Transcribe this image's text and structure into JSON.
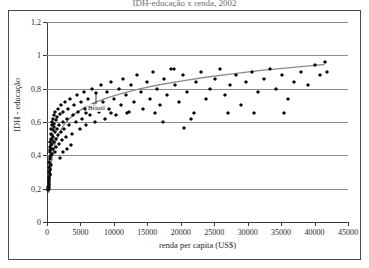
{
  "title_sliver": "IDH-educação x renda, 2002",
  "chart_data": {
    "type": "scatter",
    "title": "IDH-educação x renda, 2002",
    "xlabel": "renda per capita (US$)",
    "ylabel": "IDH - educação",
    "xlim": [
      0,
      45000
    ],
    "ylim": [
      0,
      1.2
    ],
    "xticks": [
      0,
      5000,
      10000,
      15000,
      20000,
      25000,
      30000,
      35000,
      40000,
      45000
    ],
    "xticklabels": [
      "0",
      "5000",
      "10000",
      "15000",
      "20000",
      "25000",
      "30000",
      "35000",
      "40000",
      "45000"
    ],
    "yticks": [
      0,
      0.2,
      0.4,
      0.6,
      0.8,
      1,
      1.2
    ],
    "yticklabels": [
      "0",
      "0,2",
      "0,4",
      "0,6",
      "0,8",
      "1",
      "1,2"
    ],
    "grid": "horizontal",
    "legend": "none",
    "marker": "diamond",
    "marker_color": "#0d0d0d",
    "gridline_color": "#8c8c8c",
    "axis_color": "#3a3a3a",
    "trendline": {
      "type": "logarithmic",
      "color": "#8a8a8a",
      "points": [
        [
          250,
          0.175
        ],
        [
          400,
          0.26
        ],
        [
          600,
          0.34
        ],
        [
          850,
          0.41
        ],
        [
          1200,
          0.47
        ],
        [
          1700,
          0.525
        ],
        [
          2400,
          0.575
        ],
        [
          3200,
          0.615
        ],
        [
          4200,
          0.65
        ],
        [
          5500,
          0.685
        ],
        [
          7000,
          0.715
        ],
        [
          9000,
          0.745
        ],
        [
          11500,
          0.775
        ],
        [
          14000,
          0.8
        ],
        [
          17000,
          0.825
        ],
        [
          20000,
          0.845
        ],
        [
          24000,
          0.87
        ],
        [
          28000,
          0.89
        ],
        [
          32000,
          0.91
        ],
        [
          36000,
          0.925
        ],
        [
          40000,
          0.94
        ],
        [
          41500,
          0.945
        ]
      ]
    },
    "annotations": [
      {
        "text": "Brasil",
        "x": 7400,
        "y": 0.685,
        "point_x": 7400,
        "point_y": 0.775
      }
    ],
    "points": [
      [
        180,
        0.2
      ],
      [
        200,
        0.21
      ],
      [
        210,
        0.19
      ],
      [
        230,
        0.24
      ],
      [
        250,
        0.22
      ],
      [
        260,
        0.26
      ],
      [
        270,
        0.2
      ],
      [
        280,
        0.3
      ],
      [
        300,
        0.23
      ],
      [
        310,
        0.27
      ],
      [
        330,
        0.33
      ],
      [
        340,
        0.21
      ],
      [
        350,
        0.36
      ],
      [
        360,
        0.25
      ],
      [
        380,
        0.29
      ],
      [
        390,
        0.39
      ],
      [
        400,
        0.32
      ],
      [
        410,
        0.42
      ],
      [
        430,
        0.28
      ],
      [
        440,
        0.45
      ],
      [
        450,
        0.35
      ],
      [
        470,
        0.31
      ],
      [
        480,
        0.48
      ],
      [
        500,
        0.38
      ],
      [
        520,
        0.43
      ],
      [
        540,
        0.5
      ],
      [
        560,
        0.34
      ],
      [
        580,
        0.46
      ],
      [
        600,
        0.53
      ],
      [
        620,
        0.4
      ],
      [
        650,
        0.56
      ],
      [
        670,
        0.44
      ],
      [
        690,
        0.49
      ],
      [
        710,
        0.58
      ],
      [
        740,
        0.41
      ],
      [
        760,
        0.52
      ],
      [
        790,
        0.6
      ],
      [
        820,
        0.47
      ],
      [
        850,
        0.55
      ],
      [
        880,
        0.62
      ],
      [
        910,
        0.44
      ],
      [
        950,
        0.51
      ],
      [
        980,
        0.57
      ],
      [
        1020,
        0.64
      ],
      [
        1060,
        0.48
      ],
      [
        1100,
        0.59
      ],
      [
        1150,
        0.42
      ],
      [
        1200,
        0.54
      ],
      [
        1250,
        0.66
      ],
      [
        1300,
        0.5
      ],
      [
        1360,
        0.61
      ],
      [
        1420,
        0.45
      ],
      [
        1480,
        0.56
      ],
      [
        1550,
        0.63
      ],
      [
        1620,
        0.52
      ],
      [
        1700,
        0.68
      ],
      [
        1780,
        0.47
      ],
      [
        1860,
        0.58
      ],
      [
        1950,
        0.65
      ],
      [
        2050,
        0.54
      ],
      [
        2150,
        0.7
      ],
      [
        2250,
        0.49
      ],
      [
        2350,
        0.6
      ],
      [
        2450,
        0.66
      ],
      [
        2600,
        0.56
      ],
      [
        2750,
        0.72
      ],
      [
        2900,
        0.51
      ],
      [
        3050,
        0.62
      ],
      [
        3200,
        0.68
      ],
      [
        3350,
        0.58
      ],
      [
        3500,
        0.74
      ],
      [
        3700,
        0.53
      ],
      [
        3900,
        0.64
      ],
      [
        4100,
        0.7
      ],
      [
        4300,
        0.6
      ],
      [
        4500,
        0.76
      ],
      [
        4700,
        0.66
      ],
      [
        4900,
        0.56
      ],
      [
        5100,
        0.72
      ],
      [
        5300,
        0.62
      ],
      [
        5500,
        0.78
      ],
      [
        5700,
        0.68
      ],
      [
        5900,
        0.58
      ],
      [
        6100,
        0.74
      ],
      [
        6400,
        0.64
      ],
      [
        6700,
        0.8
      ],
      [
        7000,
        0.7
      ],
      [
        7200,
        0.6
      ],
      [
        7400,
        0.775
      ],
      [
        7700,
        0.66
      ],
      [
        8000,
        0.82
      ],
      [
        8300,
        0.72
      ],
      [
        8600,
        0.62
      ],
      [
        8900,
        0.78
      ],
      [
        9200,
        0.68
      ],
      [
        9600,
        0.84
      ],
      [
        10000,
        0.74
      ],
      [
        10300,
        0.64
      ],
      [
        10700,
        0.8
      ],
      [
        11000,
        0.7
      ],
      [
        11400,
        0.86
      ],
      [
        11800,
        0.76
      ],
      [
        12200,
        0.66
      ],
      [
        12600,
        0.82
      ],
      [
        13000,
        0.72
      ],
      [
        13500,
        0.88
      ],
      [
        14000,
        0.78
      ],
      [
        14400,
        0.68
      ],
      [
        14900,
        0.84
      ],
      [
        15400,
        0.74
      ],
      [
        15900,
        0.9
      ],
      [
        16400,
        0.8
      ],
      [
        16900,
        0.7
      ],
      [
        17500,
        0.86
      ],
      [
        18000,
        0.76
      ],
      [
        18600,
        0.92
      ],
      [
        19200,
        0.82
      ],
      [
        19800,
        0.72
      ],
      [
        20400,
        0.88
      ],
      [
        21000,
        0.78
      ],
      [
        21600,
        0.62
      ],
      [
        22300,
        0.84
      ],
      [
        23000,
        0.9
      ],
      [
        23700,
        0.74
      ],
      [
        24400,
        0.8
      ],
      [
        25100,
        0.86
      ],
      [
        25900,
        0.92
      ],
      [
        26600,
        0.76
      ],
      [
        27400,
        0.82
      ],
      [
        28200,
        0.88
      ],
      [
        29000,
        0.7
      ],
      [
        29800,
        0.84
      ],
      [
        30600,
        0.9
      ],
      [
        31500,
        0.78
      ],
      [
        32400,
        0.86
      ],
      [
        33300,
        0.92
      ],
      [
        34200,
        0.8
      ],
      [
        35100,
        0.88
      ],
      [
        36000,
        0.74
      ],
      [
        37000,
        0.84
      ],
      [
        38000,
        0.9
      ],
      [
        39000,
        0.82
      ],
      [
        40000,
        0.94
      ],
      [
        40800,
        0.88
      ],
      [
        41500,
        0.96
      ],
      [
        41800,
        0.9
      ],
      [
        1900,
        0.385
      ],
      [
        2400,
        0.42
      ],
      [
        3000,
        0.44
      ],
      [
        3600,
        0.46
      ],
      [
        5800,
        0.655
      ],
      [
        9500,
        0.655
      ],
      [
        12000,
        0.655
      ],
      [
        16200,
        0.655
      ],
      [
        19000,
        0.92
      ],
      [
        22000,
        0.655
      ],
      [
        27000,
        0.655
      ],
      [
        31000,
        0.655
      ],
      [
        35500,
        0.655
      ],
      [
        20500,
        0.565
      ],
      [
        17300,
        0.6
      ]
    ]
  }
}
